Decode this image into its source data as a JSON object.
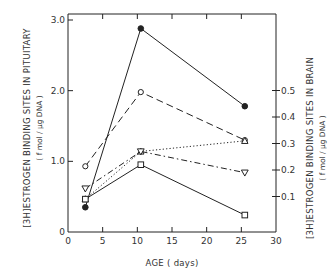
{
  "chart_data": {
    "type": "line",
    "title": "",
    "xlabel": "AGE (days)",
    "ylabel": "[3H]ESTROGEN BINDING SITES IN PITUITARY",
    "ylabel_units": "(fmol/µg DNA)",
    "y2label": "[3H]ESTROGEN BINDING SITES IN BRAIN",
    "y2label_units": "(fmol/µg DNA)",
    "xlim": [
      0,
      30
    ],
    "ylim": [
      0,
      3.0
    ],
    "y2lim": [
      0,
      0.55
    ],
    "x_ticks": [
      "0",
      "5",
      "10",
      "15",
      "20",
      "25",
      "30"
    ],
    "y_ticks": [
      "0",
      "1.0",
      "2.0",
      "3.0"
    ],
    "y2_ticks": [
      "0.1",
      "0.2",
      "0.3",
      "0.4",
      "0.5"
    ],
    "grid": false,
    "legend": "none",
    "x": [
      2.5,
      10.5,
      25.5
    ],
    "series": [
      {
        "name": "pituitary-filled-circle",
        "axis": "left",
        "marker": "filled-circle",
        "line": "solid",
        "values": [
          0.35,
          2.88,
          1.78
        ]
      },
      {
        "name": "pituitary-open-circle",
        "axis": "left",
        "marker": "open-circle",
        "line": "dashed",
        "values": [
          0.93,
          1.98,
          1.3
        ]
      },
      {
        "name": "brain-triangle-up",
        "axis": "right",
        "marker": "open-triangle-up",
        "line": "dotted",
        "values": [
          0.09,
          0.27,
          0.31
        ]
      },
      {
        "name": "brain-triangle-down",
        "axis": "right",
        "marker": "open-triangle-down",
        "line": "dash-dot",
        "values": [
          0.13,
          0.27,
          0.19
        ]
      },
      {
        "name": "brain-square",
        "axis": "right",
        "marker": "open-square",
        "line": "solid",
        "values": [
          0.09,
          0.22,
          0.03
        ]
      }
    ]
  },
  "labels": {
    "xlabel": "AGE  ( days)",
    "ylabel_left_prefix": "3H",
    "ylabel_left_main": "ESTROGEN  BINDING  SITES  IN  PITUITARY",
    "ylabel_left_units": "( f mol / µg  DNA )",
    "ylabel_right_prefix": "3H",
    "ylabel_right_main": "ESTROGEN  BINDING  SITES  IN  BRAIN",
    "ylabel_right_units": "( f mol / µg  DNA )"
  },
  "colors": {
    "ink": "#222222",
    "background": "#ffffff"
  }
}
